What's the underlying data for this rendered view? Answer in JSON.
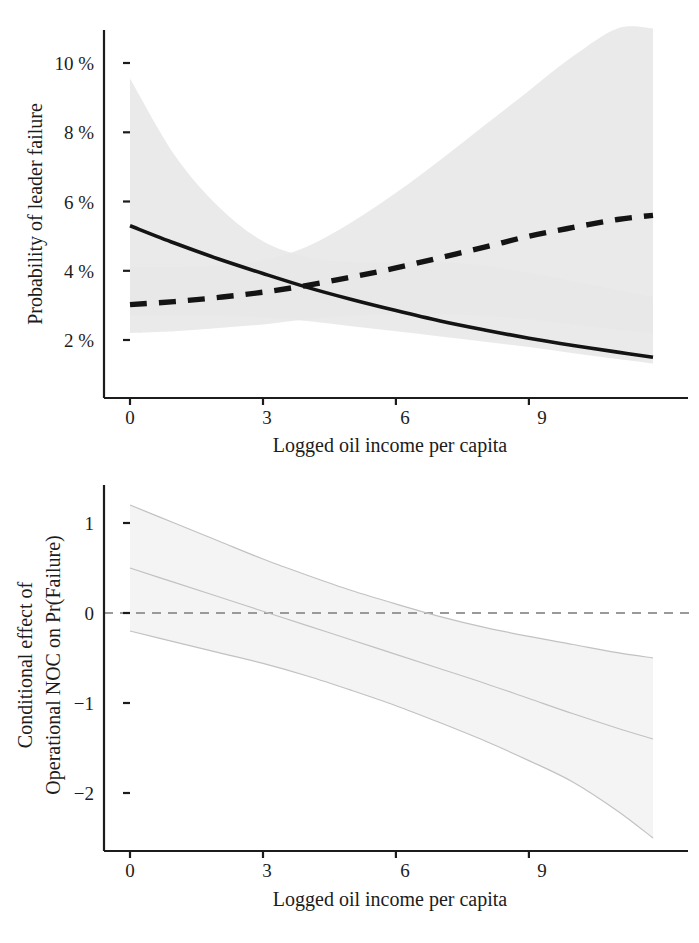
{
  "figure": {
    "background": "#ffffff",
    "ink_color": "#1c1c1c",
    "band_color": "#e6e6e6",
    "band_color_dark": "#d6d6d6",
    "dashed_grey": "#8a8a8a"
  },
  "panels": {
    "top": {
      "name": "probability-of-leader-failure-panel",
      "xlabel": "Logged oil income per capita",
      "ylabel": "Probability of leader failure",
      "xticks": [
        "0",
        "3",
        "6",
        "9"
      ],
      "yticks": [
        "10 %",
        "8 %",
        "6 %",
        "4 %",
        "2 %"
      ]
    },
    "bottom": {
      "name": "conditional-effect-panel",
      "xlabel": "Logged oil income per capita",
      "ylabel_line1": "Conditional effect of",
      "ylabel_line2": "Operational NOC on Pr(Failure)",
      "xticks": [
        "0",
        "3",
        "6",
        "9"
      ],
      "yticks": [
        "1",
        "0",
        "−1",
        "−2"
      ]
    }
  },
  "chart_data": [
    {
      "type": "line",
      "id": "top",
      "title": "",
      "xlabel": "Logged oil income per capita",
      "ylabel": "Probability of leader failure",
      "xlim": [
        0,
        11.8
      ],
      "ylim": [
        0.6,
        11.0
      ],
      "xticks": [
        0,
        3,
        6,
        9
      ],
      "xticklabels": [
        "0",
        "3",
        "6",
        "9"
      ],
      "yticks": [
        2,
        4,
        6,
        8,
        10
      ],
      "yticklabels": [
        "2 %",
        "4 %",
        "6 %",
        "8 %",
        "10 %"
      ],
      "yunit": "percent",
      "grid": false,
      "legend": "none",
      "x": [
        0,
        1,
        2,
        3,
        4,
        5,
        6,
        7,
        8,
        9,
        10,
        11,
        11.8
      ],
      "series": [
        {
          "name": "No Operational NOC",
          "style": "solid",
          "color": "#111111",
          "values": [
            5.3,
            4.8,
            4.34,
            3.92,
            3.52,
            3.17,
            2.85,
            2.55,
            2.29,
            2.05,
            1.84,
            1.65,
            1.5
          ],
          "ci_upper": [
            9.55,
            7.35,
            5.85,
            4.85,
            4.4,
            4.25,
            4.25,
            4.25,
            4.15,
            3.95,
            3.7,
            3.45,
            3.25
          ],
          "ci_lower": [
            2.7,
            2.7,
            2.7,
            2.65,
            2.55,
            2.4,
            2.25,
            2.1,
            1.95,
            1.8,
            1.62,
            1.45,
            1.32
          ]
        },
        {
          "name": "Operational NOC",
          "style": "dashed",
          "color": "#1c1c1c",
          "values": [
            3.02,
            3.11,
            3.23,
            3.38,
            3.58,
            3.82,
            4.08,
            4.38,
            4.68,
            5.0,
            5.25,
            5.48,
            5.6
          ],
          "ci_upper": [
            4.1,
            4.1,
            4.15,
            4.3,
            4.7,
            5.4,
            6.25,
            7.2,
            8.2,
            9.2,
            10.2,
            11.0,
            11.0
          ],
          "ci_lower": [
            2.2,
            2.25,
            2.35,
            2.45,
            2.6,
            2.7,
            2.75,
            2.75,
            2.7,
            2.6,
            2.45,
            2.3,
            2.2
          ]
        }
      ]
    },
    {
      "type": "line",
      "id": "bottom",
      "title": "",
      "xlabel": "Logged oil income per capita",
      "ylabel": "Conditional effect of Operational NOC on Pr(Failure)",
      "xlim": [
        0,
        11.8
      ],
      "ylim": [
        -2.75,
        1.45
      ],
      "xticks": [
        0,
        3,
        6,
        9
      ],
      "xticklabels": [
        "0",
        "3",
        "6",
        "9"
      ],
      "yticks": [
        1,
        0,
        -1,
        -2
      ],
      "yticklabels": [
        "1",
        "0",
        "−1",
        "−2"
      ],
      "grid": false,
      "legend": "none",
      "reference_line": {
        "y": 0,
        "style": "dashed",
        "color": "#9a9a9a"
      },
      "x": [
        0,
        1,
        2,
        3,
        4,
        5,
        6,
        7,
        8,
        9,
        10,
        11,
        11.8
      ],
      "series": [
        {
          "name": "Conditional effect (point estimate)",
          "style": "solid-thin",
          "color": "#b9b9b9",
          "values": [
            0.5,
            0.34,
            0.18,
            0.02,
            -0.14,
            -0.3,
            -0.46,
            -0.62,
            -0.78,
            -0.95,
            -1.12,
            -1.28,
            -1.4
          ],
          "ci_upper": [
            1.2,
            1.0,
            0.8,
            0.6,
            0.42,
            0.25,
            0.1,
            -0.04,
            -0.16,
            -0.26,
            -0.35,
            -0.44,
            -0.5
          ],
          "ci_lower": [
            -0.2,
            -0.32,
            -0.44,
            -0.56,
            -0.7,
            -0.86,
            -1.03,
            -1.22,
            -1.42,
            -1.64,
            -1.88,
            -2.2,
            -2.5
          ]
        }
      ]
    }
  ]
}
